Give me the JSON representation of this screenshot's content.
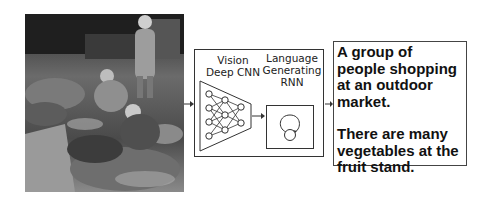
{
  "diagram": {
    "input_image": {
      "description": "grayscale photo of people at an outdoor vegetable market"
    },
    "model": {
      "encoder_label_line1": "Vision",
      "encoder_label_line2": "Deep CNN",
      "decoder_label_line1": "Language",
      "decoder_label_line2": "Generating",
      "decoder_label_line3": "RNN"
    },
    "captions": [
      "A group of people shopping at an outdoor market.",
      "There are many vegetables at the fruit stand."
    ],
    "flow": [
      "input_image",
      "Vision Deep CNN",
      "Language Generating RNN",
      "captions"
    ]
  }
}
